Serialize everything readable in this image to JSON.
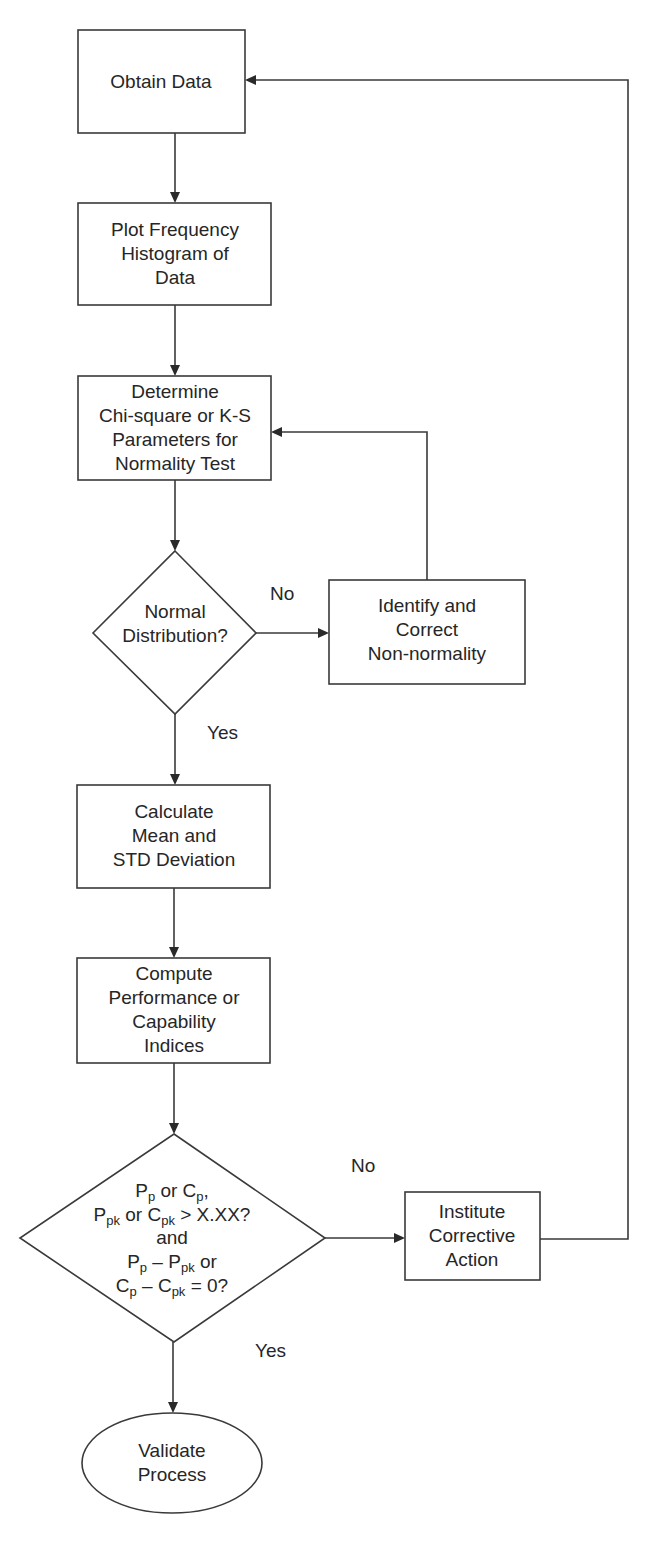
{
  "diagram": {
    "type": "flowchart",
    "nodes": {
      "obtain": {
        "shape": "rectangle",
        "lines": [
          "Obtain Data"
        ]
      },
      "histogram": {
        "shape": "rectangle",
        "lines": [
          "Plot Frequency",
          "Histogram of",
          "Data"
        ]
      },
      "determine": {
        "shape": "rectangle",
        "lines": [
          "Determine",
          "Chi-square or K-S",
          "Parameters for",
          "Normality Test"
        ]
      },
      "normal": {
        "shape": "diamond",
        "lines": [
          "Normal",
          "Distribution?"
        ]
      },
      "identify": {
        "shape": "rectangle",
        "lines": [
          "Identify and",
          "Correct",
          "Non-normality"
        ]
      },
      "calculate": {
        "shape": "rectangle",
        "lines": [
          "Calculate",
          "Mean and",
          "STD Deviation"
        ]
      },
      "compute": {
        "shape": "rectangle",
        "lines": [
          "Compute",
          "Performance or",
          "Capability",
          "Indices"
        ]
      },
      "capability_check": {
        "shape": "diamond",
        "line1": {
          "a": "P",
          "a_sub": "p",
          "b": " or C",
          "b_sub": "p",
          "c": ","
        },
        "line2": {
          "a": "P",
          "a_sub": "pk",
          "b": " or C",
          "b_sub": "pk",
          "c": " > X.XX?"
        },
        "line3": "and",
        "line4": {
          "a": "P",
          "a_sub": "p",
          "b": " – P",
          "b_sub": "pk",
          "c": " or"
        },
        "line5": {
          "a": "C",
          "a_sub": "p",
          "b": " – C",
          "b_sub": "pk",
          "c": " = 0?"
        }
      },
      "corrective": {
        "shape": "rectangle",
        "lines": [
          "Institute",
          "Corrective",
          "Action"
        ]
      },
      "validate": {
        "shape": "ellipse",
        "lines": [
          "Validate",
          "Process"
        ]
      }
    },
    "edge_labels": {
      "normal_no": "No",
      "normal_yes": "Yes",
      "capability_no": "No",
      "capability_yes": "Yes"
    },
    "edges": [
      {
        "from": "obtain",
        "to": "histogram"
      },
      {
        "from": "histogram",
        "to": "determine"
      },
      {
        "from": "determine",
        "to": "normal"
      },
      {
        "from": "normal",
        "to": "identify",
        "label": "No"
      },
      {
        "from": "identify",
        "to": "determine"
      },
      {
        "from": "normal",
        "to": "calculate",
        "label": "Yes"
      },
      {
        "from": "calculate",
        "to": "compute"
      },
      {
        "from": "compute",
        "to": "capability_check"
      },
      {
        "from": "capability_check",
        "to": "corrective",
        "label": "No"
      },
      {
        "from": "corrective",
        "to": "obtain"
      },
      {
        "from": "capability_check",
        "to": "validate",
        "label": "Yes"
      }
    ]
  }
}
